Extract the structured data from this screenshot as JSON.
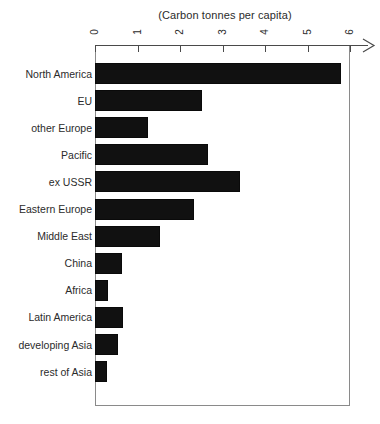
{
  "chart": {
    "title": "(Carbon tonnes per capita)",
    "axis_tick_labels": [
      "0",
      "1",
      "2",
      "3",
      "4",
      "5",
      "6"
    ],
    "bar_color": "#111111",
    "frame_color": "#8a8a8a",
    "axis_color": "#4a4a4a",
    "axis_arrow_name": "x-axis-arrow"
  },
  "chart_data": {
    "type": "bar",
    "orientation": "horizontal",
    "title": "(Carbon tonnes per capita)",
    "xlabel": "",
    "ylabel": "",
    "xlim": [
      0,
      6
    ],
    "xticks": [
      0,
      1,
      2,
      3,
      4,
      5,
      6
    ],
    "grid": false,
    "legend": false,
    "categories": [
      "North America",
      "EU",
      "other Europe",
      "Pacific",
      "ex USSR",
      "Eastern Europe",
      "Middle East",
      "China",
      "Africa",
      "Latin America",
      "developing Asia",
      "rest of Asia"
    ],
    "values": [
      5.78,
      2.51,
      1.25,
      2.65,
      3.41,
      2.32,
      1.52,
      0.64,
      0.3,
      0.66,
      0.55,
      0.29
    ]
  }
}
